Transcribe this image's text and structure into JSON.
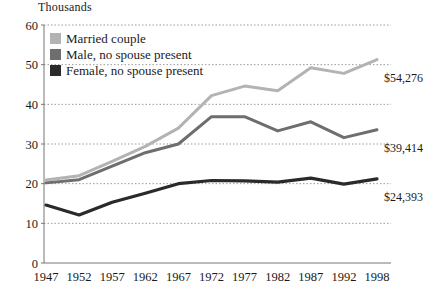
{
  "chart_data": {
    "type": "line",
    "title": "",
    "subtitle": "",
    "unit_label": "Thousands",
    "xlabel": "",
    "ylabel": "",
    "ylim": [
      0,
      60
    ],
    "ytick_values": [
      0,
      10,
      20,
      30,
      40,
      50,
      60
    ],
    "ytick_labels": [
      "0",
      "10",
      "20",
      "30",
      "40",
      "50",
      "60"
    ],
    "grid": true,
    "grid_style": "dotted",
    "legend_position": "top-left",
    "categories": [
      "1947",
      "1952",
      "1957",
      "1962",
      "1967",
      "1972",
      "1977",
      "1982",
      "1987",
      "1992",
      "1998"
    ],
    "x": [
      1947,
      1952,
      1957,
      1962,
      1967,
      1972,
      1977,
      1982,
      1987,
      1992,
      1998
    ],
    "series": [
      {
        "name": "Married couple",
        "color": "#b3b3b3",
        "end_label": "$54,276",
        "values": [
          20.9,
          22.0,
          25.6,
          29.4,
          34.0,
          42.2,
          44.6,
          43.4,
          49.2,
          47.8,
          51.3
        ]
      },
      {
        "name": "Male, no spouse present",
        "color": "#6e6e6e",
        "end_label": "$39,414",
        "values": [
          20.2,
          21.0,
          24.4,
          27.8,
          30.0,
          36.9,
          36.9,
          33.3,
          35.6,
          31.6,
          33.6
        ]
      },
      {
        "name": "Female, no spouse present",
        "color": "#2a2a2a",
        "end_label": "$24,393",
        "values": [
          14.6,
          12.1,
          15.3,
          17.6,
          20.0,
          20.8,
          20.7,
          20.4,
          21.4,
          19.9,
          21.2
        ]
      }
    ]
  },
  "legend": {
    "items": [
      {
        "label": "Married couple",
        "color": "#b3b3b3"
      },
      {
        "label": "Male, no spouse present",
        "color": "#6e6e6e"
      },
      {
        "label": "Female, no spouse present",
        "color": "#2a2a2a"
      }
    ]
  }
}
